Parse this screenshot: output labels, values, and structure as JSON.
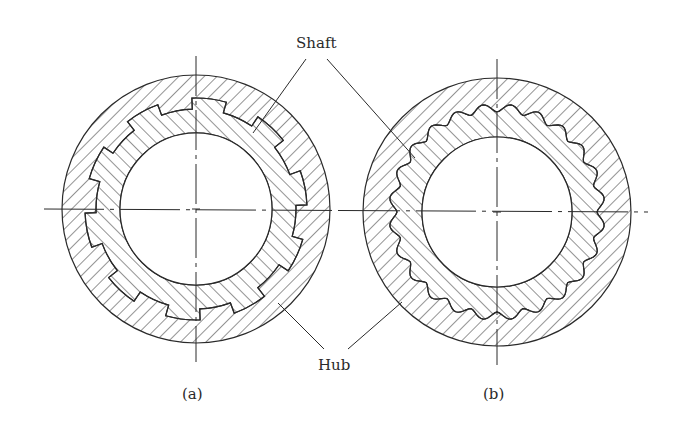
{
  "labels": {
    "shaft": "Shaft",
    "hub": "Hub",
    "caption_a": "(a)",
    "caption_b": "(b)"
  },
  "colors": {
    "ink": "#2a2a2a",
    "background": "#ffffff"
  },
  "figures": [
    {
      "id": "a",
      "type": "straight-sided spline",
      "center": [
        196,
        209
      ],
      "outer_radius": 134,
      "tooth_tip_radius": 111,
      "root_radius": 100,
      "bore_radius": 76,
      "teeth": 10,
      "tooth_half_width_deg": 9
    },
    {
      "id": "b",
      "type": "involute spline",
      "center": [
        497,
        212
      ],
      "outer_radius": 134,
      "tooth_tip_radius": 108,
      "root_radius": 100,
      "bore_radius": 75,
      "teeth": 24
    }
  ],
  "leaders": {
    "shaft": [
      [
        306,
        59,
        253,
        133
      ],
      [
        327,
        59,
        415,
        158
      ]
    ],
    "hub": [
      [
        324,
        349,
        278,
        303
      ],
      [
        348,
        349,
        402,
        302
      ]
    ]
  },
  "center_lines": {
    "horizontal_y_a": 209,
    "horizontal_y_b": 212,
    "x_start": 44,
    "x_end": 648
  }
}
